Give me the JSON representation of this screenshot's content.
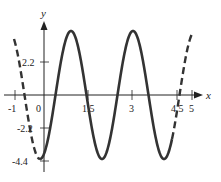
{
  "chart_data": {
    "type": "line",
    "title": "",
    "xlabel": "x",
    "ylabel": "y",
    "x_ticks": [
      {
        "value": -1,
        "label": "-1"
      },
      {
        "value": 0,
        "label": "0"
      },
      {
        "value": 1.5,
        "label": "1.5"
      },
      {
        "value": 3,
        "label": "3"
      },
      {
        "value": 4.5,
        "label": "4.5"
      },
      {
        "value": 5,
        "label": "5"
      }
    ],
    "y_ticks": [
      {
        "value": 2.2,
        "label": "2.2"
      },
      {
        "value": -2.2,
        "label": "-2.2"
      },
      {
        "value": -4.4,
        "label": "-4.4"
      }
    ],
    "xlim": [
      -1,
      5
    ],
    "ylim": [
      -4.4,
      4.4
    ],
    "grid": false,
    "series": [
      {
        "name": "curve (solid, on [0, 4.5])",
        "style": "solid",
        "function": "sinusoid, amplitude 4.4, period ~2.1, minimum at x≈0",
        "x": [
          0,
          1.05,
          2.1,
          3.15,
          4.2,
          4.5
        ],
        "y": [
          -4.4,
          4.4,
          -4.4,
          4.4,
          -4.4,
          -2.0
        ]
      },
      {
        "name": "curve extension left",
        "style": "dashed",
        "x": [
          -1,
          0
        ],
        "y": [
          3.6,
          -4.4
        ]
      },
      {
        "name": "curve extension right",
        "style": "dashed",
        "x": [
          4.5,
          5
        ],
        "y": [
          -2.0,
          4.2
        ]
      }
    ],
    "colors": {
      "curve": "#333333",
      "axes": "#222222"
    }
  }
}
